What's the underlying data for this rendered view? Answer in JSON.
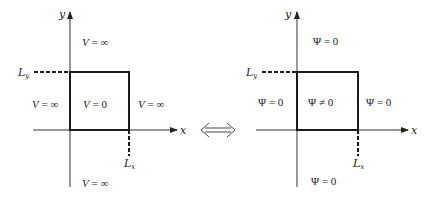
{
  "left_diagram": {
    "axis_x_label": "x",
    "axis_y_label": "y",
    "ly_label": "L",
    "ly_sub": "y",
    "lx_label": "L",
    "lx_sub": "x",
    "top_region": {
      "var": "V",
      "rel": " = ∞"
    },
    "left_region": {
      "var": "V",
      "rel": " = ∞"
    },
    "inside_region": {
      "var": "V",
      "rel": " = 0"
    },
    "right_region": {
      "var": "V",
      "rel": " = ∞"
    },
    "bottom_region": {
      "var": "V",
      "rel": " = ∞"
    }
  },
  "equivalence_symbol": "⟺",
  "right_diagram": {
    "axis_x_label": "x",
    "axis_y_label": "y",
    "ly_label": "L",
    "ly_sub": "y",
    "lx_label": "L",
    "lx_sub": "x",
    "top_region": {
      "var": "Ψ",
      "rel": " = 0"
    },
    "left_region": {
      "var": "Ψ",
      "rel": " = 0"
    },
    "inside_region": {
      "var": "Ψ",
      "rel": " ≠ 0"
    },
    "right_region": {
      "var": "Ψ",
      "rel": " = 0"
    },
    "bottom_region": {
      "var": "Ψ",
      "rel": " = 0"
    }
  },
  "colors": {
    "line": "#1a1a1a",
    "axis": "#333333",
    "background": "#ffffff"
  }
}
